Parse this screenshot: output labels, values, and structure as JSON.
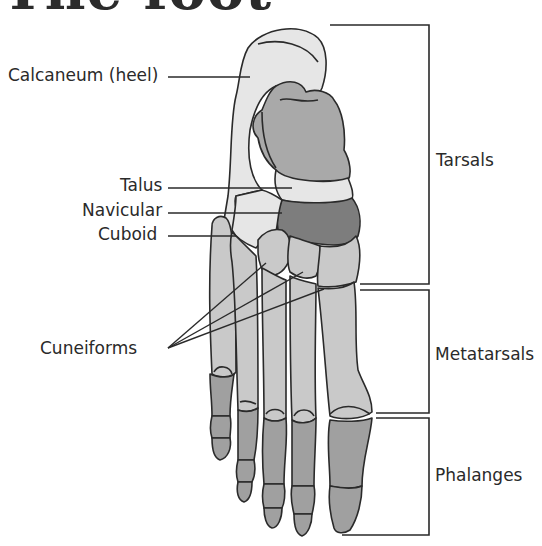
{
  "title": "The foot",
  "labels": {
    "calcaneum": "Calcaneum (heel)",
    "talus": "Talus",
    "navicular": "Navicular",
    "cuboid": "Cuboid",
    "cuneiforms": "Cuneiforms"
  },
  "groups": {
    "tarsals": "Tarsals",
    "metatarsals": "Metatarsals",
    "phalanges": "Phalanges"
  },
  "colors": {
    "light_bone": "#e6e6e6",
    "mid_bone": "#c9c9c9",
    "talus_fill": "#a9a9a9",
    "navicular_fill": "#7d7d7d",
    "phalanx_fill": "#a0a0a0",
    "outline": "#2a2a2a",
    "text": "#2a2a2a"
  }
}
